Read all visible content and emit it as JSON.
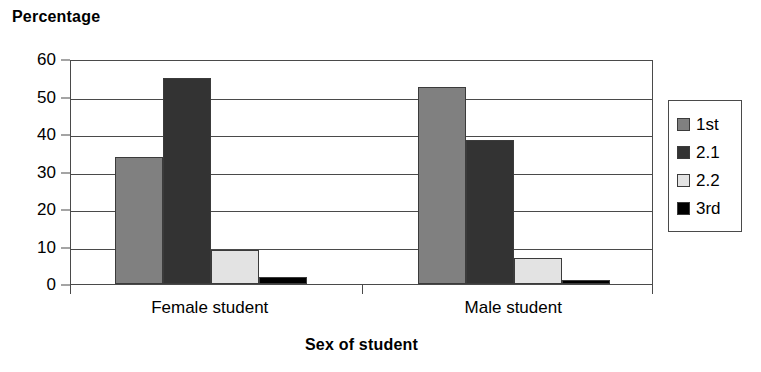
{
  "chart_data": {
    "type": "bar",
    "title": "",
    "xlabel": "Sex of student",
    "ylabel": "Percentage",
    "categories": [
      "Female student",
      "Male student"
    ],
    "series": [
      {
        "name": "1st",
        "values": [
          34,
          52.5
        ],
        "color": "#808080"
      },
      {
        "name": "2.1",
        "values": [
          55,
          38.5
        ],
        "color": "#333333"
      },
      {
        "name": "2.2",
        "values": [
          9,
          7
        ],
        "color": "#e3e3e3"
      },
      {
        "name": "3rd",
        "values": [
          2,
          1
        ],
        "color": "#000000"
      }
    ],
    "ylim": [
      0,
      60
    ],
    "yticks": [
      0,
      10,
      20,
      30,
      40,
      50,
      60
    ],
    "ytick_labels": [
      "0",
      "10",
      "20",
      "30",
      "40",
      "50",
      "60"
    ],
    "grid": true,
    "grid_axis": "y",
    "legend_position": "right",
    "bar_gap_within_group": 0
  },
  "axes": {
    "y_title": "Percentage",
    "x_title": "Sex of student"
  },
  "legend": {
    "items": [
      {
        "label": "1st"
      },
      {
        "label": "2.1"
      },
      {
        "label": "2.2"
      },
      {
        "label": "3rd"
      }
    ]
  },
  "colors": {
    "axis": "#4a4a4a",
    "bar_outline": "#3b3b3b",
    "background": "#ffffff",
    "series_1st": "#808080",
    "series_21": "#333333",
    "series_22": "#e3e3e3",
    "series_3rd": "#000000"
  }
}
